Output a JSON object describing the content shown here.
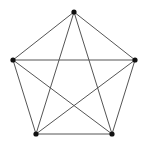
{
  "diagram": {
    "type": "graph",
    "name": "complete graph K5",
    "colors": {
      "background": "#ffffff",
      "edge": "#555555",
      "node": "#111111"
    },
    "node_radius": 2.6,
    "edge_width": 1,
    "nodes": [
      {
        "id": "top",
        "x": 74,
        "y": 12
      },
      {
        "id": "right",
        "x": 135,
        "y": 60
      },
      {
        "id": "bottom-right",
        "x": 112,
        "y": 134
      },
      {
        "id": "bottom-left",
        "x": 36,
        "y": 134
      },
      {
        "id": "left",
        "x": 13,
        "y": 60
      }
    ],
    "edges": [
      [
        "top",
        "right"
      ],
      [
        "right",
        "bottom-right"
      ],
      [
        "bottom-right",
        "bottom-left"
      ],
      [
        "bottom-left",
        "left"
      ],
      [
        "left",
        "top"
      ],
      [
        "top",
        "bottom-right"
      ],
      [
        "top",
        "bottom-left"
      ],
      [
        "right",
        "bottom-left"
      ],
      [
        "right",
        "left"
      ],
      [
        "bottom-right",
        "left"
      ]
    ]
  }
}
